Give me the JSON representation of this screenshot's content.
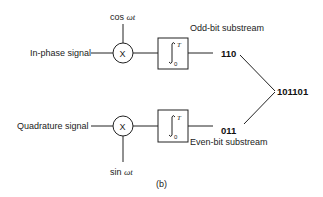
{
  "diagram": {
    "caption": "(b)",
    "inphase": {
      "input_label": "In-phase signal",
      "carrier_prefix": "cos ",
      "carrier_var": "ωt",
      "multiplier_symbol": "X",
      "integrator_upper": "T",
      "integrator_lower": "0",
      "substream_label": "Odd-bit substream",
      "bits": "110"
    },
    "quadrature": {
      "input_label": "Quadrature signal",
      "carrier_prefix": "sin ",
      "carrier_var": "ωt",
      "multiplier_symbol": "X",
      "integrator_upper": "T",
      "integrator_lower": "0",
      "substream_label": "Even-bit substream",
      "bits": "011"
    },
    "output_bits": "101101"
  }
}
